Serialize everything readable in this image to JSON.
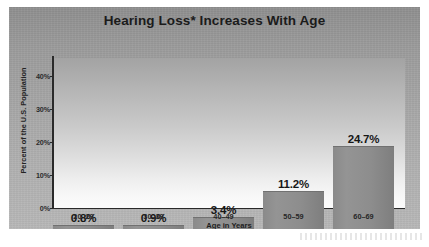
{
  "chart_data": {
    "type": "bar",
    "title": "Hearing Loss* Increases With Age",
    "xlabel": "Age in Years",
    "ylabel": "Percent of the U.S. Population",
    "categories": [
      "20–29",
      "30–39",
      "40–49",
      "50–59",
      "60–69"
    ],
    "values": [
      0.8,
      0.9,
      3.4,
      11.2,
      24.7
    ],
    "data_labels": [
      "0.8%",
      "0.9%",
      "3.4%",
      "11.2%",
      "24.7%"
    ],
    "ylim": [
      0,
      45
    ],
    "ytick_values": [
      0,
      10,
      20,
      30,
      40
    ],
    "ytick_labels": [
      "0%",
      "10%",
      "20%",
      "30%",
      "40%"
    ],
    "grid": false,
    "legend": null,
    "series": [
      {
        "name": "Percent of the U.S. Population",
        "values": [
          0.8,
          0.9,
          3.4,
          11.2,
          24.7
        ]
      }
    ],
    "colors": {
      "bar": "#8f8f8f",
      "axis": "#2a2a2a",
      "title_text": "#1b1b1b",
      "label_text": "#262626",
      "panel_top": "#8e8e8e",
      "panel_bottom": "#b7b7b7",
      "plot_top": "#a3a3a3",
      "plot_bottom": "#fbfbfb"
    }
  }
}
